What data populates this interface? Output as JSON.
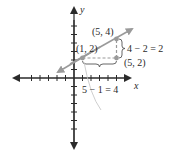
{
  "diagram": {
    "type": "coordinate-plane-slope",
    "axes": {
      "x_label": "x",
      "y_label": "y"
    },
    "line_color": "#9a9a9a",
    "axis_color": "#2a2a2a",
    "points": [
      {
        "label": "(1, 2)",
        "x": 1,
        "y": 2
      },
      {
        "label": "(5, 4)",
        "x": 5,
        "y": 4
      },
      {
        "label": "(5, 2)",
        "x": 5,
        "y": 2
      }
    ],
    "rise_label": "4 − 2 = 2",
    "run_label": "5 − 1 = 4"
  }
}
